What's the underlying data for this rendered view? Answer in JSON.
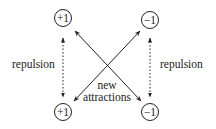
{
  "nodes": [
    {
      "id": "top-left",
      "label": "+1",
      "cx": 63,
      "cy": 18
    },
    {
      "id": "top-right",
      "label": "−1",
      "cx": 150,
      "cy": 20
    },
    {
      "id": "bottom-left",
      "label": "+1",
      "cx": 63,
      "cy": 112
    },
    {
      "id": "bottom-right",
      "label": "−1",
      "cx": 150,
      "cy": 112
    }
  ],
  "labels": {
    "left_repulsion": "repulsion",
    "right_repulsion": "repulsion",
    "center_line1": "new",
    "center_line2": "attractions"
  },
  "edges": [
    {
      "from": "top-left",
      "to": "bottom-left",
      "type": "dotted-double-arrow",
      "meaning": "repulsion"
    },
    {
      "from": "top-right",
      "to": "bottom-right",
      "type": "dotted-double-arrow",
      "meaning": "repulsion"
    },
    {
      "from": "top-left",
      "to": "bottom-right",
      "type": "solid-double-arrow",
      "meaning": "new attraction"
    },
    {
      "from": "top-right",
      "to": "bottom-left",
      "type": "solid-double-arrow",
      "meaning": "new attraction"
    }
  ],
  "colors": {
    "ink": "#222222",
    "background": "#ffffff"
  }
}
